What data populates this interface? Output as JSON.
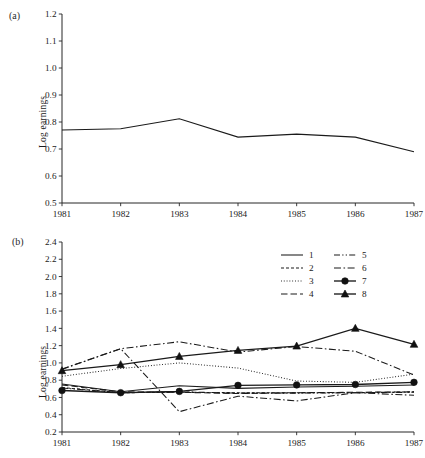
{
  "figure": {
    "panel_a_tag": "(a)",
    "panel_b_tag": "(b)",
    "ylabel": "Log earnings"
  },
  "chart_data": [
    {
      "id": "panel-a",
      "type": "line",
      "title": "(a)",
      "xlabel": "",
      "ylabel": "Log earnings",
      "x": [
        1981,
        1982,
        1983,
        1984,
        1985,
        1986,
        1987
      ],
      "xticklabels": [
        "1981",
        "1982",
        "1983",
        "1984",
        "1985",
        "1986",
        "1987"
      ],
      "yticks": [
        0.5,
        0.6,
        0.7,
        0.8,
        0.9,
        1.0,
        1.1,
        1.2
      ],
      "yticklabels": [
        "0.5",
        "0.6",
        "0.7",
        "0.8",
        "0.9",
        "1.0",
        "1.1",
        "1.2"
      ],
      "ylim": [
        0.5,
        1.2
      ],
      "xlim": [
        1981,
        1987
      ],
      "grid": false,
      "legend": null,
      "series": [
        {
          "name": "overall",
          "linestyle": "solid",
          "marker": "none",
          "values": [
            0.77,
            0.775,
            0.812,
            0.744,
            0.755,
            0.744,
            0.69
          ]
        }
      ]
    },
    {
      "id": "panel-b",
      "type": "line",
      "title": "(b)",
      "xlabel": "",
      "ylabel": "Log earnings",
      "x": [
        1981,
        1982,
        1983,
        1984,
        1985,
        1986,
        1987
      ],
      "xticklabels": [
        "1981",
        "1982",
        "1983",
        "1984",
        "1985",
        "1986",
        "1987"
      ],
      "yticks": [
        0.2,
        0.4,
        0.6,
        0.8,
        1.0,
        1.2,
        1.4,
        1.6,
        1.8,
        2.0,
        2.2,
        2.4
      ],
      "yticklabels": [
        "0.2",
        "0.4",
        "0.6",
        "0.8",
        "1.0",
        "1.2",
        "1.4",
        "1.6",
        "1.8",
        "2.0",
        "2.2",
        "2.4"
      ],
      "ylim": [
        0.2,
        2.4
      ],
      "xlim": [
        1981,
        1987
      ],
      "grid": false,
      "legend_position": "upper-right",
      "legend_entries": [
        "1",
        "2",
        "3",
        "4",
        "5",
        "6",
        "7",
        "8"
      ],
      "series": [
        {
          "name": "1",
          "linestyle": "solid",
          "marker": "none",
          "values": [
            0.755,
            0.665,
            0.735,
            0.705,
            0.72,
            0.73,
            0.745
          ]
        },
        {
          "name": "2",
          "linestyle": "dashed-short",
          "marker": "none",
          "values": [
            0.715,
            0.655,
            0.66,
            0.655,
            0.655,
            0.655,
            0.665
          ]
        },
        {
          "name": "3",
          "linestyle": "dotted",
          "marker": "none",
          "values": [
            0.845,
            0.935,
            1.0,
            0.94,
            0.79,
            0.775,
            0.87
          ]
        },
        {
          "name": "4",
          "linestyle": "dashed-long",
          "marker": "none",
          "values": [
            0.745,
            0.665,
            0.66,
            0.645,
            0.655,
            0.66,
            0.665
          ]
        },
        {
          "name": "5",
          "linestyle": "dash-dot-dot",
          "marker": "none",
          "values": [
            0.71,
            0.655,
            0.665,
            0.65,
            0.65,
            0.655,
            0.66
          ]
        },
        {
          "name": "6",
          "linestyle": "dash-dot",
          "marker": "none",
          "values": [
            0.925,
            1.165,
            0.435,
            0.615,
            0.56,
            0.655,
            0.625
          ]
        },
        {
          "name": "7",
          "linestyle": "solid",
          "marker": "circle",
          "values": [
            0.68,
            0.655,
            0.67,
            0.74,
            0.745,
            0.75,
            0.775
          ]
        },
        {
          "name": "8",
          "linestyle": "solid",
          "marker": "triangle",
          "values": [
            0.91,
            0.98,
            1.075,
            1.145,
            1.195,
            1.4,
            1.215
          ]
        }
      ],
      "extra_series_note": {
        "name": "6-upper-arc",
        "linestyle": "dash-dot",
        "values": [
          0.93,
          1.165,
          1.245,
          1.125,
          1.19,
          1.135,
          0.86
        ]
      }
    }
  ]
}
